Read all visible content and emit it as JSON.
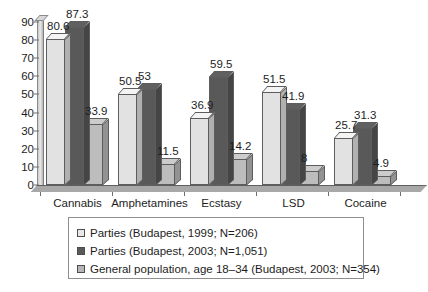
{
  "chart_data": {
    "type": "bar",
    "title": "",
    "xlabel": "",
    "ylabel": "",
    "ylim": [
      0,
      90
    ],
    "ytick_step": 10,
    "yticks": [
      "90",
      "80",
      "70",
      "60",
      "50",
      "40",
      "30",
      "20",
      "10",
      "0"
    ],
    "grid": false,
    "legend_position": "bottom",
    "categories": [
      "Cannabis",
      "Amphetamines",
      "Ecstasy",
      "LSD",
      "Cocaine"
    ],
    "series": [
      {
        "name": "Parties (Budapest, 1999; N=206)",
        "color": "#e2e2e2",
        "values": [
          80.6,
          50.5,
          36.9,
          51.5,
          25.7
        ],
        "labels": [
          "80.6",
          "50.5",
          "36.9",
          "51.5",
          "25.7"
        ]
      },
      {
        "name": "Parties (Budapest, 2003; N=1,051)",
        "color": "#595959",
        "values": [
          87.3,
          53,
          59.5,
          41.9,
          31.3
        ],
        "labels": [
          "87.3",
          "53",
          "59.5",
          "41.9",
          "31.3"
        ]
      },
      {
        "name": "General population, age 18–34 (Budapest, 2003; N=354)",
        "color": "#bdbdbd",
        "values": [
          33.9,
          11.5,
          14.2,
          8,
          4.9
        ],
        "labels": [
          "33.9",
          "11.5",
          "14.2",
          "8",
          "4.9"
        ]
      }
    ]
  },
  "legend": {
    "items": [
      {
        "label": "Parties (Budapest, 1999; N=206)",
        "swatch": "#e8e8e8"
      },
      {
        "label": "Parties (Budapest, 2003; N=1,051)",
        "swatch": "#5a5a5a"
      },
      {
        "label": "General population, age 18–34 (Budapest, 2003; N=354)",
        "swatch": "#b6b6b6"
      }
    ]
  },
  "colors": {
    "series1": "#e2e2e2",
    "series2": "#595959",
    "series3": "#bdbdbd",
    "axis": "#6f6f6f",
    "text": "#1d1d1d",
    "background": "#ffffff"
  }
}
